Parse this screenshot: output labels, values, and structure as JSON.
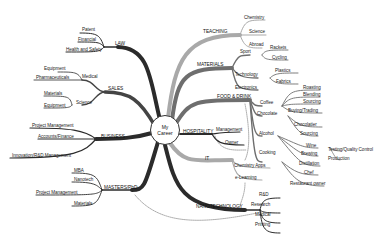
{
  "center": {
    "line1": "My",
    "line2": "Career"
  },
  "branches": {
    "law": {
      "label": "LAW",
      "children": [
        "Patent",
        "Financial",
        "Health and Safety"
      ]
    },
    "sales": {
      "label": "SALES",
      "medical": {
        "label": "Medical",
        "children": [
          "Equipment",
          "Pharmaceuticals"
        ]
      },
      "science": {
        "label": "Science",
        "children": [
          "Materials",
          "Equipment"
        ]
      }
    },
    "business": {
      "label": "BUSINESS",
      "children": [
        "Project Management",
        "Accounts/Finance",
        "Innovation/R&D Management"
      ]
    },
    "masters": {
      "label": "MASTERS/PhD",
      "children": [
        "MBA",
        "Nanotech",
        "Project Management",
        "Materials"
      ]
    },
    "teaching": {
      "label": "TEACHING",
      "children": [
        "Chemistry",
        "Science",
        "Abroad"
      ]
    },
    "materials": {
      "label": "MATERIALS",
      "sport": {
        "label": "Sport",
        "children": [
          "Rackets",
          "Cycling"
        ]
      },
      "technology": {
        "label": "Technology",
        "children": [
          "Plastics",
          "Fabrics"
        ]
      },
      "electronics": {
        "label": "Electronics"
      }
    },
    "food": {
      "label": "FOOD & DRINK",
      "coffee": {
        "label": "Coffee",
        "children": [
          "Roasting",
          "Blending",
          "Sourcing",
          "Buying/Trading"
        ]
      },
      "chocolate": {
        "label": "Chocolate",
        "children": [
          "Chocolatier",
          "Sourcing"
        ]
      },
      "alcohol": {
        "label": "Alcohol",
        "wine": {
          "label": "Wine",
          "children": [
            "Testing/Quality Control",
            "Production"
          ]
        },
        "brewing": "Brewing",
        "distillation": "Distillation"
      },
      "cooking": {
        "label": "Cooking",
        "children": [
          "Chef",
          "Restaurant owner"
        ]
      }
    },
    "hospitality": {
      "label": "HOSPITALITY",
      "children": [
        "Management",
        "Owner"
      ]
    },
    "it": {
      "label": "IT",
      "children": [
        "Chemistry Apps",
        "e-Learning"
      ]
    },
    "nanotech": {
      "label": "NANOTECHNOLOGY",
      "children": [
        "R&D",
        "Research",
        "Medical",
        "Printing"
      ]
    }
  },
  "colors": {
    "dark_branch": "#2b2b2b",
    "mid_branch": "#6e6e6e",
    "light_branch": "#a9a9a9",
    "connector": "#555555"
  }
}
